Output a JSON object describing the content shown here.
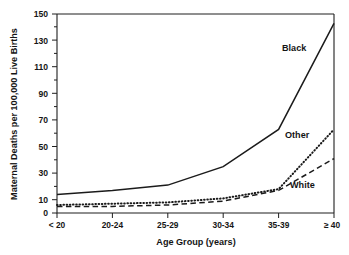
{
  "figure": {
    "background_color": "#ffffff",
    "ink_color": "#1b1b1b"
  },
  "chart_data": {
    "type": "line",
    "title": "",
    "xlabel": "Age Group (years)",
    "ylabel": "Maternal Deaths per 100,000 Live Births",
    "categories": [
      "< 20",
      "20-24",
      "25-29",
      "30-34",
      "35-39",
      "≥ 40"
    ],
    "yticks": [
      0,
      10,
      30,
      50,
      70,
      90,
      110,
      130,
      150
    ],
    "ytick_labels": [
      "0",
      "10",
      "30",
      "50",
      "70",
      "90",
      "110",
      "130",
      "150"
    ],
    "ylim": [
      0,
      150
    ],
    "grid": false,
    "legend_position": "inline-annotations",
    "series": [
      {
        "name": "Black",
        "style": "solid",
        "label": "Black",
        "values": [
          14,
          17,
          21,
          35,
          63,
          143
        ]
      },
      {
        "name": "Other",
        "style": "dotted",
        "label": "Other",
        "values": [
          6,
          7,
          8,
          11,
          18,
          63
        ]
      },
      {
        "name": "White",
        "style": "dashed",
        "label": "White",
        "values": [
          5,
          5,
          6,
          9,
          17,
          41
        ]
      }
    ],
    "annotations": [
      {
        "text": "Black",
        "series": "Black"
      },
      {
        "text": "Other",
        "series": "Other"
      },
      {
        "text": "White",
        "series": "White"
      }
    ]
  }
}
